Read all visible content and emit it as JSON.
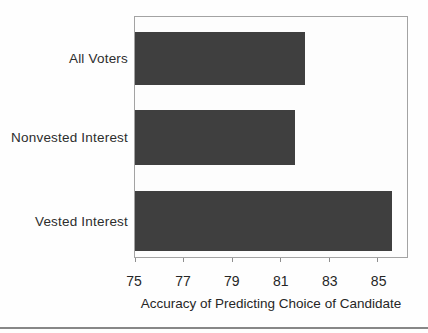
{
  "chart_data": {
    "type": "bar",
    "orientation": "horizontal",
    "title": "",
    "xlabel": "Accuracy of Predicting Choice of Candidate",
    "ylabel": "",
    "categories": [
      "All Voters",
      "Nonvested Interest",
      "Vested Interest"
    ],
    "values": [
      82,
      81.6,
      85.6
    ],
    "x_ticks": [
      75,
      77,
      79,
      81,
      83,
      85
    ],
    "xlim": [
      75,
      86.2
    ],
    "grid": false,
    "legend": false,
    "bar_color": "#3f3f3f"
  },
  "colors": {
    "bar_fill": "#3f3f3f",
    "plot_border": "#a3a3a3",
    "text": "#262626",
    "bottom_rule": "#878787",
    "background": "#ffffff"
  }
}
